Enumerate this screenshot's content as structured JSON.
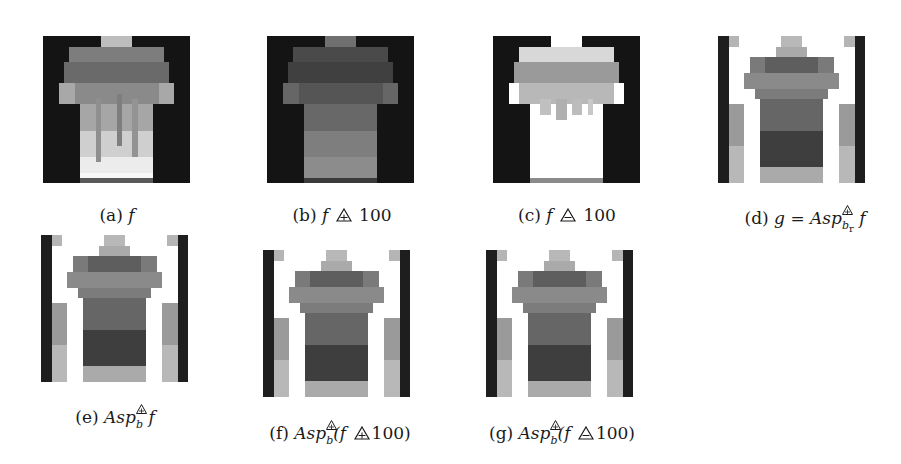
{
  "figure": {
    "panels": [
      {
        "id": "a",
        "label": "(a)",
        "pre": "",
        "var": "f",
        "op": "",
        "operand": "",
        "post": "",
        "type": "original"
      },
      {
        "id": "b",
        "label": "(b)",
        "pre": "",
        "var": "f",
        "op": "plus-triangle",
        "operand": "100",
        "post": "",
        "type": "darkened"
      },
      {
        "id": "c",
        "label": "(c)",
        "pre": "",
        "var": "f",
        "op": "minus-triangle",
        "operand": "100",
        "post": "",
        "type": "brightened"
      },
      {
        "id": "d",
        "label": "(d)",
        "pre": "g = ",
        "var": "Asp",
        "sub": "b",
        "subsub": "r",
        "post": "f",
        "type": "aspect"
      },
      {
        "id": "e",
        "label": "(e)",
        "pre": "",
        "var": "Asp",
        "sub": "b",
        "post": "f",
        "type": "aspect"
      },
      {
        "id": "f",
        "label": "(f)",
        "pre": "",
        "var": "Asp",
        "sub": "b",
        "post": "(f",
        "op": "plus-triangle",
        "operand": "100)",
        "type": "aspect"
      },
      {
        "id": "g",
        "label": "(g)",
        "pre": "",
        "var": "Asp",
        "sub": "b",
        "post": "(f",
        "op": "minus-triangle",
        "operand": "100)",
        "type": "aspect"
      }
    ],
    "captions": {
      "a": "(a) f",
      "b": "(b) f ⊕△ 100",
      "c": "(c) f ⊖△ 100",
      "d": "(d) g = Asp^△⁺_{b_r} f",
      "e": "(e) Asp^△⁺_b f",
      "f": "(f) Asp^△⁺_b (f ⊕△ 100)",
      "g": "(g) Asp^△⁺_b (f ⊖△ 100)"
    },
    "colors": {
      "background": "#111111",
      "shirt_light": "#f0f0f0",
      "shirt_mid": "#8a8a8a",
      "shirt_dark": "#4a4a4a",
      "white": "#ffffff"
    }
  }
}
